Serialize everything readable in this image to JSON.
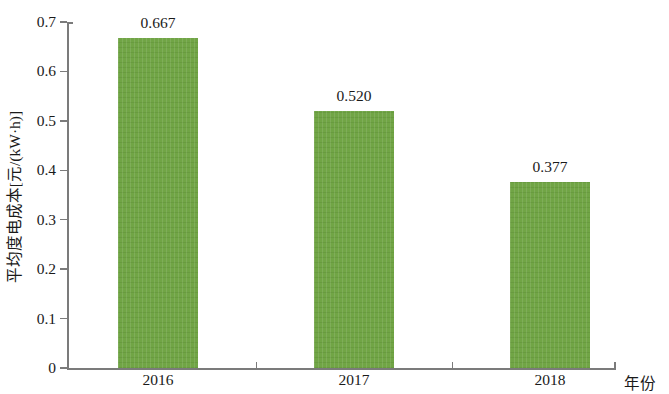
{
  "chart_data": {
    "type": "bar",
    "title": "",
    "subtitle": "",
    "xlabel": "年份",
    "ylabel": "平均度电成本[元/(kW·h)]",
    "categories": [
      "2016",
      "2017",
      "2018"
    ],
    "values": [
      0.667,
      0.52,
      0.377
    ],
    "value_labels": [
      "0.667",
      "0.520",
      "0.377"
    ],
    "series": [
      {
        "name": "平均度电成本",
        "values": [
          0.667,
          0.52,
          0.377
        ]
      }
    ],
    "ylim": [
      0,
      0.7
    ],
    "ytick_labels": [
      "0",
      "0.1",
      "0.2",
      "0.3",
      "0.4",
      "0.5",
      "0.6",
      "0.7"
    ],
    "ytick_values": [
      0,
      0.1,
      0.2,
      0.3,
      0.4,
      0.5,
      0.6,
      0.7
    ],
    "grid": false,
    "legend": false,
    "legend_position": "none",
    "bar_color": "#6ea342",
    "axis_color": "#7b7b7b",
    "text_color": "#1a1a1a",
    "background": "#ffffff"
  }
}
